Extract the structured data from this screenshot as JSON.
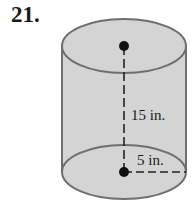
{
  "problem": {
    "number": "21."
  },
  "figure": {
    "shape": "cylinder",
    "height_label": "15 in.",
    "radius_label": "5 in.",
    "colors": {
      "fill": "#d4d4d4",
      "stroke": "#6e6e6e",
      "ink": "#111111"
    }
  }
}
